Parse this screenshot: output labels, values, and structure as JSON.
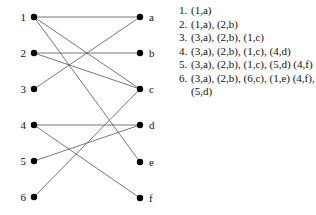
{
  "graph": {
    "left_nodes": [
      {
        "id": "1",
        "label": "1",
        "x": 34,
        "y": 17
      },
      {
        "id": "2",
        "label": "2",
        "x": 34,
        "y": 53
      },
      {
        "id": "3",
        "label": "3",
        "x": 34,
        "y": 89
      },
      {
        "id": "4",
        "label": "4",
        "x": 34,
        "y": 125
      },
      {
        "id": "5",
        "label": "5",
        "x": 34,
        "y": 161
      },
      {
        "id": "6",
        "label": "6",
        "x": 34,
        "y": 197
      }
    ],
    "right_nodes": [
      {
        "id": "a",
        "label": "a",
        "x": 140,
        "y": 17
      },
      {
        "id": "b",
        "label": "b",
        "x": 140,
        "y": 53
      },
      {
        "id": "c",
        "label": "c",
        "x": 140,
        "y": 89
      },
      {
        "id": "d",
        "label": "d",
        "x": 140,
        "y": 125
      },
      {
        "id": "e",
        "label": "e",
        "x": 140,
        "y": 162
      },
      {
        "id": "f",
        "label": "f",
        "x": 140,
        "y": 198
      }
    ],
    "edges": [
      [
        "1",
        "a"
      ],
      [
        "1",
        "c"
      ],
      [
        "1",
        "e"
      ],
      [
        "2",
        "b"
      ],
      [
        "2",
        "c"
      ],
      [
        "3",
        "a"
      ],
      [
        "4",
        "d"
      ],
      [
        "4",
        "f"
      ],
      [
        "5",
        "d"
      ],
      [
        "6",
        "c"
      ]
    ]
  },
  "steps": [
    {
      "num": "1.",
      "text": "(1,a)"
    },
    {
      "num": "2.",
      "text": "(1,a), (2,b)"
    },
    {
      "num": "3.",
      "text": "(3,a), (2,b), (1,c)"
    },
    {
      "num": "4.",
      "text": "(3,a), (2,b), (1,c), (4,d)"
    },
    {
      "num": "5.",
      "text": "(3,a), (2,b), (1,c), (5,d) (4,f)"
    },
    {
      "num": "6.",
      "text": "(3,a), (2,b), (6,c), (1,e) (4,f), (5,d)"
    }
  ]
}
